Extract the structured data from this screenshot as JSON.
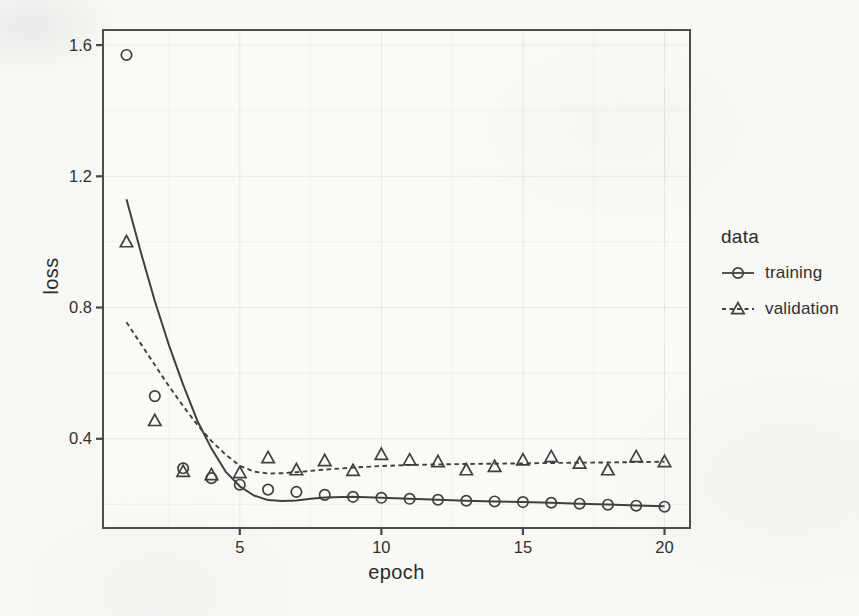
{
  "page": {
    "background": "#f8f8f5",
    "panel_background": "#fafaf7"
  },
  "colors": {
    "stroke": "#3f3f3f",
    "panel_border": "#4d4d4d",
    "tick": "#454545",
    "text": "#2f2f2f",
    "grid_major": "rgba(0,0,0,0.075)",
    "grid_minor": "rgba(0,0,0,0.045)"
  },
  "chart_data": {
    "type": "scatter",
    "xlabel": "epoch",
    "ylabel": "loss",
    "xlim": [
      0.17,
      20.9
    ],
    "ylim": [
      0.128,
      1.646
    ],
    "x_ticks": [
      5,
      10,
      15,
      20
    ],
    "y_ticks": [
      0.4,
      0.8,
      1.2,
      1.6
    ],
    "x_minor_ticks": [
      2.5,
      7.5,
      12.5,
      17.5
    ],
    "y_minor_ticks": [
      0.2,
      0.6,
      1.0,
      1.4
    ],
    "grid": "major+minor",
    "legend": {
      "title": "data",
      "position": "right",
      "entries": [
        {
          "label": "training",
          "marker": "circle",
          "linetype": "solid"
        },
        {
          "label": "validation",
          "marker": "triangle",
          "linetype": "dashed"
        }
      ]
    },
    "epochs": [
      1,
      2,
      3,
      4,
      5,
      6,
      7,
      8,
      9,
      10,
      11,
      12,
      13,
      14,
      15,
      16,
      17,
      18,
      19,
      20
    ],
    "series": [
      {
        "name": "training",
        "marker": "circle",
        "linetype": "solid",
        "values": [
          1.57,
          0.53,
          0.31,
          0.28,
          0.26,
          0.245,
          0.238,
          0.229,
          0.223,
          0.22,
          0.217,
          0.214,
          0.211,
          0.209,
          0.207,
          0.205,
          0.202,
          0.199,
          0.196,
          0.193
        ],
        "smooth": {
          "x": [
            1,
            1.5,
            2,
            2.5,
            3,
            3.5,
            4,
            4.5,
            5,
            5.5,
            6,
            6.5,
            7,
            7.5,
            8,
            9,
            10,
            11,
            12,
            13,
            14,
            15,
            16,
            17,
            18,
            19,
            20
          ],
          "y": [
            1.13,
            0.97,
            0.82,
            0.685,
            0.565,
            0.455,
            0.37,
            0.3,
            0.255,
            0.227,
            0.213,
            0.21,
            0.212,
            0.217,
            0.221,
            0.223,
            0.22,
            0.217,
            0.214,
            0.211,
            0.209,
            0.207,
            0.205,
            0.202,
            0.2,
            0.197,
            0.194
          ]
        }
      },
      {
        "name": "validation",
        "marker": "triangle",
        "linetype": "dashed",
        "values": [
          1.0,
          0.455,
          0.3,
          0.29,
          0.296,
          0.342,
          0.305,
          0.333,
          0.303,
          0.352,
          0.335,
          0.33,
          0.305,
          0.315,
          0.335,
          0.345,
          0.325,
          0.305,
          0.345,
          0.33
        ],
        "smooth": {
          "x": [
            1,
            1.5,
            2,
            2.5,
            3,
            3.5,
            4,
            4.5,
            5,
            5.5,
            6,
            6.5,
            7,
            7.5,
            8,
            9,
            10,
            11,
            12,
            13,
            14,
            15,
            16,
            17,
            18,
            19,
            20
          ],
          "y": [
            0.755,
            0.69,
            0.625,
            0.56,
            0.5,
            0.443,
            0.393,
            0.352,
            0.318,
            0.3,
            0.294,
            0.295,
            0.298,
            0.302,
            0.306,
            0.312,
            0.317,
            0.32,
            0.322,
            0.323,
            0.324,
            0.325,
            0.326,
            0.327,
            0.328,
            0.329,
            0.33
          ]
        }
      }
    ]
  }
}
